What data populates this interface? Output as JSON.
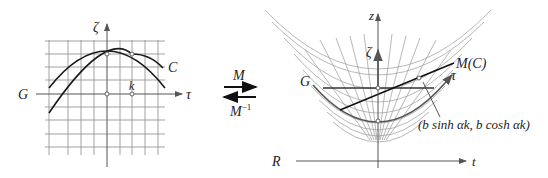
{
  "left_panel": {
    "vertical_axis_label": "ζ",
    "horizontal_axis_label": "τ",
    "line_label": "G",
    "curve_label": "C",
    "point_label": "k"
  },
  "transform": {
    "forward_label": "M",
    "inverse_label_base": "M",
    "inverse_label_exp": "−1"
  },
  "right_panel": {
    "z_axis_label": "z",
    "zeta_label": "ζ",
    "tau_label": "τ",
    "line_label": "G",
    "image_curve_label": "M(C)",
    "point_annotation": "(b sinh αk, b cosh αk)",
    "r_axis_label": "R",
    "t_axis_label": "t"
  },
  "colors": {
    "ink": "#1a1a1a",
    "grid": "#8a8a8a",
    "axis": "#555555"
  }
}
